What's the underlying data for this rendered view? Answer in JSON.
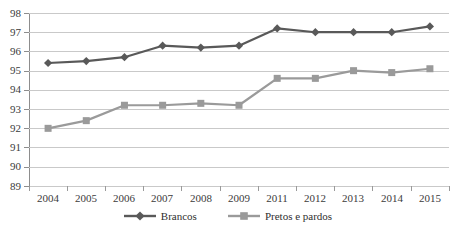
{
  "chart_data": {
    "type": "line",
    "title": "",
    "xlabel": "",
    "ylabel": "",
    "categories": [
      "2004",
      "2005",
      "2006",
      "2007",
      "2008",
      "2009",
      "2011",
      "2012",
      "2013",
      "2014",
      "2015"
    ],
    "ylim": [
      89,
      98
    ],
    "yticks": [
      "98",
      "97",
      "96",
      "95",
      "94",
      "93",
      "92",
      "91",
      "90",
      "89"
    ],
    "grid": true,
    "legend_position": "bottom",
    "series": [
      {
        "name": "Brancos",
        "color": "#595959",
        "marker": "diamond",
        "values": [
          95.4,
          95.5,
          95.7,
          96.3,
          96.2,
          96.3,
          97.2,
          97.0,
          97.0,
          97.0,
          97.3
        ]
      },
      {
        "name": "Pretos e pardos",
        "color": "#9a9a9a",
        "marker": "square",
        "values": [
          92.0,
          92.4,
          93.2,
          93.2,
          93.3,
          93.2,
          94.6,
          94.6,
          95.0,
          94.9,
          95.1
        ]
      }
    ]
  },
  "legend": {
    "entries": [
      {
        "label": "Brancos"
      },
      {
        "label": "Pretos e pardos"
      }
    ]
  },
  "axes": {
    "y_min_label": "89",
    "y_max_label": "98"
  }
}
